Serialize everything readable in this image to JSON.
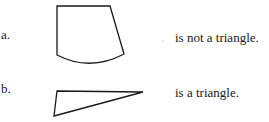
{
  "items": [
    {
      "label": "a.",
      "figure": "curved-sided quadrilateral",
      "statement": "is not a triangle."
    },
    {
      "label": "b.",
      "figure": "triangle",
      "statement": "is a triangle."
    }
  ],
  "colors": {
    "ink": "#1a1a1a",
    "background": "#ffffff"
  }
}
